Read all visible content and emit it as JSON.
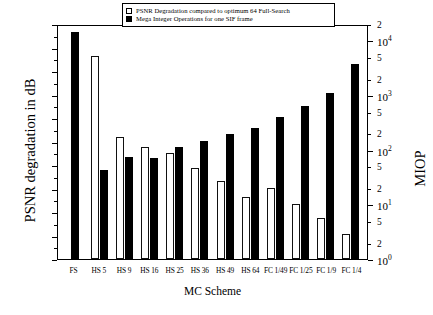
{
  "chart_data": {
    "type": "bar",
    "title": "",
    "xlabel": "MC Scheme",
    "ylabel": "PSNR degradation in dB",
    "y2label": "MIOP",
    "ylim": [
      0.0,
      5.0
    ],
    "y2lim": [
      1,
      20000
    ],
    "y2scale": "log",
    "grid": false,
    "legend_position": "top-center",
    "categories": [
      "FS",
      "HS 5",
      "HS 9",
      "HS 16",
      "HS 25",
      "HS 36",
      "HS 49",
      "HS 64",
      "FC 1/49",
      "FC 1/25",
      "FC 1/9",
      "FC 1/4"
    ],
    "series": [
      {
        "name": "PSNR Degradation compared to optimum 64 Full-Search",
        "axis": "left",
        "unit": "dB",
        "color": "#ffffff",
        "edgecolor": "#111111",
        "values": [
          0.0,
          4.33,
          2.6,
          2.39,
          2.25,
          1.93,
          1.65,
          1.33,
          1.52,
          1.17,
          0.88,
          0.54
        ]
      },
      {
        "name": "Mega Integer Operations for one SIF frame",
        "axis": "right",
        "unit": "MIOP",
        "color": "#000000",
        "values": [
          14000,
          42,
          75,
          70,
          110,
          145,
          195,
          250,
          390,
          640,
          1100,
          3700
        ]
      }
    ],
    "left_ticks": [
      "0.0",
      "0.5",
      "1.0",
      "1.5",
      "2.0",
      "2.5",
      "3.0",
      "3.5",
      "4.0",
      "4.5",
      "5.0"
    ],
    "right_ticks": [
      {
        "label": "10",
        "exp": "0",
        "major": true,
        "value": 1
      },
      {
        "label": "2",
        "exp": "",
        "major": false,
        "value": 2
      },
      {
        "label": "5",
        "exp": "",
        "major": false,
        "value": 5
      },
      {
        "label": "10",
        "exp": "1",
        "major": true,
        "value": 10
      },
      {
        "label": "2",
        "exp": "",
        "major": false,
        "value": 20
      },
      {
        "label": "5",
        "exp": "",
        "major": false,
        "value": 50
      },
      {
        "label": "10",
        "exp": "2",
        "major": true,
        "value": 100
      },
      {
        "label": "2",
        "exp": "",
        "major": false,
        "value": 200
      },
      {
        "label": "5",
        "exp": "",
        "major": false,
        "value": 500
      },
      {
        "label": "10",
        "exp": "3",
        "major": true,
        "value": 1000
      },
      {
        "label": "2",
        "exp": "",
        "major": false,
        "value": 2000
      },
      {
        "label": "5",
        "exp": "",
        "major": false,
        "value": 5000
      },
      {
        "label": "10",
        "exp": "4",
        "major": true,
        "value": 10000
      },
      {
        "label": "2",
        "exp": "",
        "major": false,
        "value": 20000
      }
    ]
  },
  "legend": {
    "entries": [
      {
        "label": "PSNR Degradation compared to optimum 64 Full-Search",
        "swatch": "white"
      },
      {
        "label": "Mega Integer Operations for one SIF frame",
        "swatch": "black"
      }
    ]
  }
}
